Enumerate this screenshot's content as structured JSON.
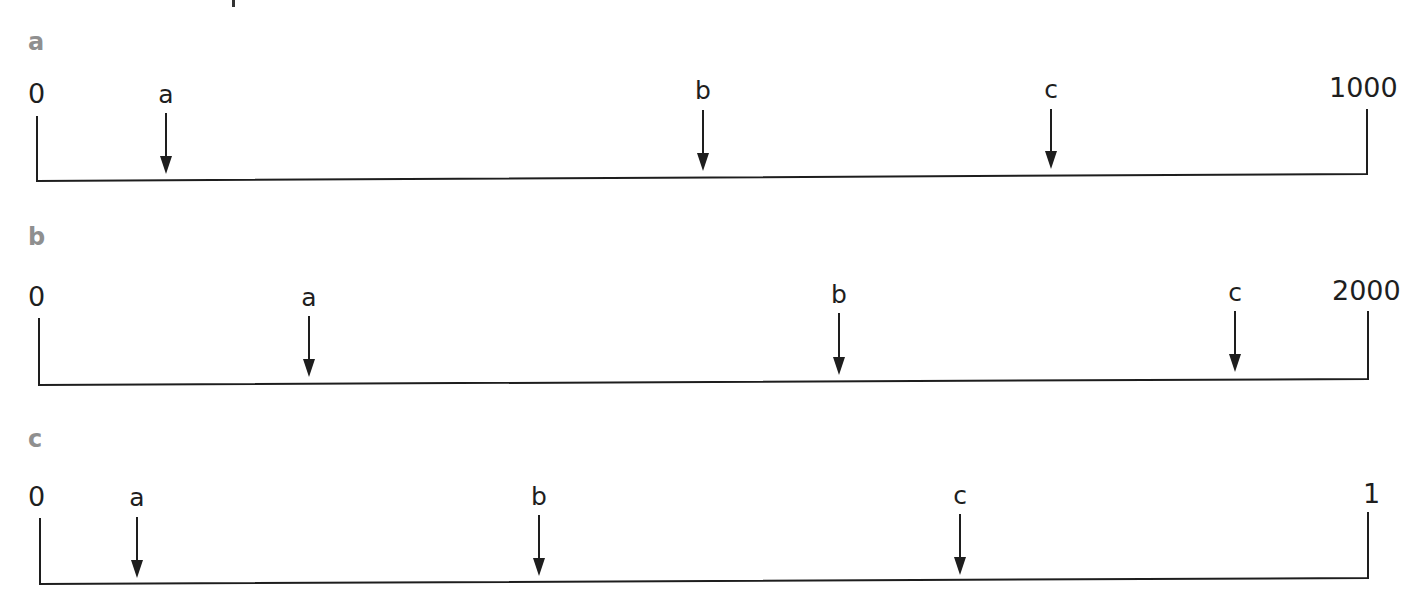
{
  "top_fragment": {
    "x": 232,
    "y": 0,
    "w": 3,
    "h": 7
  },
  "panels": [
    {
      "id": "a",
      "label": "a",
      "label_pos": {
        "x": 28,
        "y": 50
      },
      "start": "0",
      "end": "1000",
      "start_pos": {
        "x": 28,
        "y": 103
      },
      "end_pos": {
        "x": 1329,
        "y": 97
      },
      "axis": {
        "x1": 37,
        "y1": 181,
        "x2": 1367,
        "y2": 174,
        "tick_left_top": 116,
        "tick_right_top": 109
      },
      "markers": [
        {
          "name": "a",
          "x": 166,
          "label_y": 103,
          "top": 113,
          "tip": 174
        },
        {
          "name": "b",
          "x": 703,
          "label_y": 99,
          "top": 110,
          "tip": 171
        },
        {
          "name": "c",
          "x": 1051,
          "label_y": 98,
          "top": 109,
          "tip": 169
        }
      ]
    },
    {
      "id": "b",
      "label": "b",
      "label_pos": {
        "x": 28,
        "y": 245
      },
      "start": "0",
      "end": "2000",
      "start_pos": {
        "x": 28,
        "y": 306
      },
      "end_pos": {
        "x": 1332,
        "y": 300
      },
      "axis": {
        "x1": 39,
        "y1": 385,
        "x2": 1368,
        "y2": 379,
        "tick_left_top": 318,
        "tick_right_top": 311
      },
      "markers": [
        {
          "name": "a",
          "x": 309,
          "label_y": 306,
          "top": 316,
          "tip": 377
        },
        {
          "name": "b",
          "x": 839,
          "label_y": 303,
          "top": 313,
          "tip": 375
        },
        {
          "name": "c",
          "x": 1235,
          "label_y": 301,
          "top": 311,
          "tip": 372
        }
      ]
    },
    {
      "id": "c",
      "label": "c",
      "label_pos": {
        "x": 28,
        "y": 447
      },
      "start": "0",
      "end": "1",
      "start_pos": {
        "x": 28,
        "y": 506
      },
      "end_pos": {
        "x": 1363,
        "y": 503
      },
      "axis": {
        "x1": 40,
        "y1": 584,
        "x2": 1368,
        "y2": 578,
        "tick_left_top": 518,
        "tick_right_top": 512
      },
      "markers": [
        {
          "name": "a",
          "x": 137,
          "label_y": 506,
          "top": 517,
          "tip": 578
        },
        {
          "name": "b",
          "x": 539,
          "label_y": 505,
          "top": 515,
          "tip": 576
        },
        {
          "name": "c",
          "x": 960,
          "label_y": 504,
          "top": 514,
          "tip": 575
        }
      ]
    }
  ],
  "chart_data": [
    {
      "type": "number-line",
      "title": "a",
      "range": [
        0,
        1000
      ],
      "tick_labels": [
        "0",
        "1000"
      ],
      "markers": [
        {
          "label": "a",
          "approx_value": 100
        },
        {
          "label": "b",
          "approx_value": 500
        },
        {
          "label": "c",
          "approx_value": 760
        }
      ]
    },
    {
      "type": "number-line",
      "title": "b",
      "range": [
        0,
        2000
      ],
      "tick_labels": [
        "0",
        "2000"
      ],
      "markers": [
        {
          "label": "a",
          "approx_value": 400
        },
        {
          "label": "b",
          "approx_value": 1200
        },
        {
          "label": "c",
          "approx_value": 1800
        }
      ]
    },
    {
      "type": "number-line",
      "title": "c",
      "range": [
        0,
        1
      ],
      "tick_labels": [
        "0",
        "1"
      ],
      "markers": [
        {
          "label": "a",
          "approx_value": 0.07
        },
        {
          "label": "b",
          "approx_value": 0.38
        },
        {
          "label": "c",
          "approx_value": 0.7
        }
      ]
    }
  ]
}
